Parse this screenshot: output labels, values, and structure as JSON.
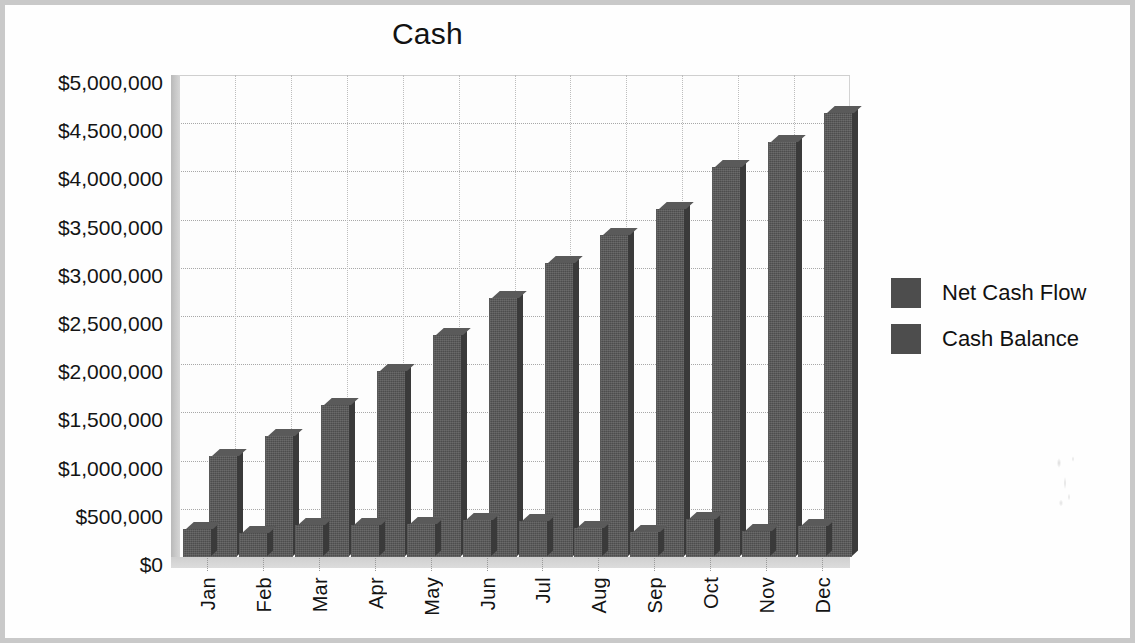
{
  "chart_data": {
    "type": "bar",
    "title": "Cash",
    "xlabel": "",
    "ylabel": "",
    "ylim": [
      0,
      5000000
    ],
    "ytick_step": 500000,
    "grid": true,
    "legend_position": "right",
    "style": "3d-clustered-column",
    "categories": [
      "Jan",
      "Feb",
      "Mar",
      "Apr",
      "May",
      "Jun",
      "Jul",
      "Aug",
      "Sep",
      "Oct",
      "Nov",
      "Dec"
    ],
    "ytick_labels": [
      "$0",
      "$500,000",
      "$1,000,000",
      "$1,500,000",
      "$2,000,000",
      "$2,500,000",
      "$3,000,000",
      "$3,500,000",
      "$4,000,000",
      "$4,500,000",
      "$5,000,000"
    ],
    "ytick_values": [
      0,
      500000,
      1000000,
      1500000,
      2000000,
      2500000,
      3000000,
      3500000,
      4000000,
      4500000,
      5000000
    ],
    "series": [
      {
        "name": "Net Cash Flow",
        "color": "#4d4d4d",
        "values": [
          290000,
          250000,
          330000,
          330000,
          340000,
          380000,
          370000,
          300000,
          260000,
          390000,
          270000,
          320000
        ]
      },
      {
        "name": "Cash Balance",
        "color": "#4d4d4d",
        "values": [
          1050000,
          1260000,
          1580000,
          1930000,
          2300000,
          2690000,
          3050000,
          3340000,
          3610000,
          4050000,
          4300000,
          4610000
        ]
      }
    ]
  },
  "legend": {
    "items": [
      {
        "label": "Net Cash Flow",
        "color": "#4d4d4d"
      },
      {
        "label": "Cash Balance",
        "color": "#4d4d4d"
      }
    ]
  },
  "frame": {
    "border_color": "#c9c9c9",
    "background": "#ffffff"
  }
}
